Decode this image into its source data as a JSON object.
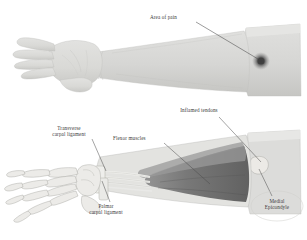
{
  "figure": {
    "title_visible": false,
    "background_color": "#ffffff",
    "ink_color": "#3a3a3a",
    "leader_color": "#555555"
  },
  "upper_figure": {
    "name": "surface-anatomy-arm",
    "description_visible": false,
    "skin_color": "#d8d8d6",
    "skin_shadow_color": "#c2c2c0",
    "pain_spot_color": "#4a4a4a",
    "labels": [
      {
        "id": "area-of-pain",
        "text": "Area of pain",
        "x": 152,
        "y": 16,
        "leader_from": [
          196,
          22
        ],
        "leader_to": [
          259,
          60
        ]
      }
    ]
  },
  "lower_figure": {
    "name": "anatomical-cutaway-arm",
    "skin_color": "#dcdcda",
    "bone_color": "#e7e7e4",
    "bone_outline_color": "#9a9a96",
    "muscle_color": "#6e6e6e",
    "muscle_light_color": "#8f8f8f",
    "tendon_color": "#efefec",
    "labels": [
      {
        "id": "inflamed-tendons",
        "text": "Inflamed tendons",
        "lines": [
          "Inflamed tendons"
        ],
        "x": 167,
        "y": 108,
        "leader_from": [
          219,
          116
        ],
        "leader_to": [
          262,
          163
        ]
      },
      {
        "id": "transverse-carpal-ligament",
        "text": "Transverse carpal ligament",
        "lines": [
          "Transverse",
          "carpal ligament"
        ],
        "x": 41,
        "y": 126,
        "leader_from": [
          93,
          139
        ],
        "leader_to": [
          107,
          172
        ]
      },
      {
        "id": "flexor-muscles",
        "text": "Flexor muscles",
        "lines": [
          "Flexor muscles"
        ],
        "x": 113,
        "y": 136,
        "leader_from": [
          164,
          143
        ],
        "leader_to": [
          211,
          185
        ]
      },
      {
        "id": "palmar-carpal-ligament",
        "text": "Palmar carpal ligament",
        "lines": [
          "Palmar",
          "carpal ligament"
        ],
        "x": 79,
        "y": 204,
        "leader_from": [
          110,
          203
        ],
        "leader_to": [
          101,
          180
        ]
      },
      {
        "id": "medial-epicondyle",
        "text": "Medial Epicondyle",
        "lines": [
          "Medial",
          "Epicondyle"
        ],
        "x": 257,
        "y": 199,
        "leader_from": [
          272,
          197
        ],
        "leader_to": [
          259,
          168
        ],
        "callout_shape": "oval"
      }
    ]
  }
}
